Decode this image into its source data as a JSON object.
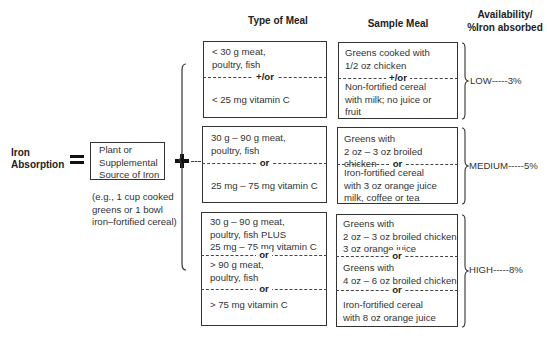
{
  "headers": {
    "type_of_meal": "Type of Meal",
    "sample_meal": "Sample Meal",
    "availability_line1": "Availability/",
    "availability_line2": "%Iron absorbed"
  },
  "equation": {
    "label_line1": "Iron",
    "label_line2": "Absorption",
    "equals": "=",
    "source_box": [
      "Plant or",
      "Supplemental",
      "Source of Iron"
    ],
    "example": [
      "(e.g., 1 cup cooked",
      "greens or 1 bowl",
      "iron–fortified cereal)"
    ],
    "plus": "+"
  },
  "groups": [
    {
      "level": "LOW-----3%",
      "type_sections": [
        [
          "< 30 g meat,",
          "poultry, fish"
        ],
        [
          "< 25 mg vitamin C"
        ]
      ],
      "type_dividers": [
        "+/or"
      ],
      "sample_sections": [
        [
          "Greens cooked with",
          "1/2 oz chicken"
        ],
        [
          "Non-fortified cereal",
          "with milk; no juice or",
          "fruit"
        ]
      ],
      "sample_dividers": [
        "+/or"
      ]
    },
    {
      "level": "MEDIUM-----5%",
      "type_sections": [
        [
          "30 g – 90 g meat,",
          "poultry, fish"
        ],
        [
          "25 mg – 75 mg vitamin C"
        ]
      ],
      "type_dividers": [
        "or"
      ],
      "sample_sections": [
        [
          "Greens with",
          "2 oz – 3 oz broiled chicken"
        ],
        [
          "Iron-fortified cereal",
          "with 3 oz orange juice",
          "milk, coffee or tea"
        ]
      ],
      "sample_dividers": [
        "or"
      ]
    },
    {
      "level": "HIGH-----8%",
      "type_sections": [
        [
          "30 g – 90 g meat,",
          "poultry, fish PLUS",
          "25 mg – 75 mg vitamin C"
        ],
        [
          "> 90 g meat,",
          "poultry, fish"
        ],
        [
          "> 75 mg vitamin C"
        ]
      ],
      "type_dividers": [
        "or",
        "or"
      ],
      "sample_sections": [
        [
          "Greens with",
          "2 oz – 3 oz broiled chicken",
          "3 oz orange juice"
        ],
        [
          "Greens with",
          "4 oz – 6 oz broiled chicken"
        ],
        [
          "Iron-fortified cereal",
          "with 8 oz orange juice"
        ]
      ],
      "sample_dividers": [
        "or",
        "or"
      ]
    }
  ]
}
